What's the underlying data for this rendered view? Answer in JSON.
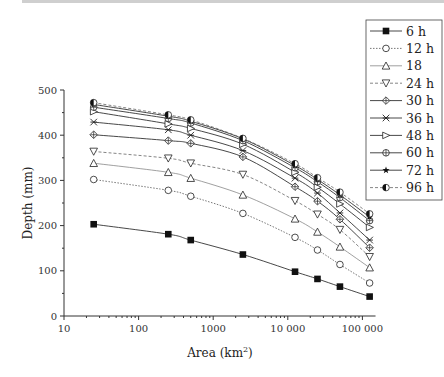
{
  "chart_data": {
    "type": "line",
    "title": "",
    "xlabel": "Area (km²)",
    "xlabel_base": "Area (km",
    "xlabel_sup": "2",
    "xlabel_end": ")",
    "ylabel": "Depth (mm)",
    "xscale": "log",
    "xlim": [
      10,
      150000
    ],
    "ylim": [
      0,
      500
    ],
    "x_ticks": [
      10,
      100,
      1000,
      10000,
      100000
    ],
    "x_tick_labels": [
      "10",
      "100",
      "1000",
      "10 000",
      "100 000"
    ],
    "y_ticks": [
      0,
      100,
      200,
      300,
      400,
      500
    ],
    "y_tick_labels": [
      "0",
      "100",
      "200",
      "300",
      "400",
      "500"
    ],
    "grid": false,
    "legend_position": "upper right (outside plot area)",
    "x": [
      25,
      250,
      500,
      2500,
      12500,
      25000,
      50000,
      125000
    ],
    "series": [
      {
        "name": "6 h",
        "marker": "filled-square",
        "line": "solid",
        "values": [
          203,
          181,
          168,
          136,
          98,
          82,
          65,
          43
        ]
      },
      {
        "name": "12 h",
        "marker": "open-circle",
        "line": "dotted",
        "values": [
          302,
          278,
          265,
          227,
          174,
          146,
          114,
          73
        ]
      },
      {
        "name": "18",
        "marker": "open-triangle-up",
        "line": "solid-light",
        "values": [
          338,
          318,
          305,
          268,
          215,
          186,
          153,
          107
        ]
      },
      {
        "name": "24 h",
        "marker": "open-triangle-down",
        "line": "dashed",
        "values": [
          364,
          349,
          338,
          313,
          255,
          225,
          191,
          131
        ]
      },
      {
        "name": "30 h",
        "marker": "diamond-cross",
        "line": "solid",
        "values": [
          401,
          388,
          382,
          352,
          286,
          254,
          214,
          151
        ]
      },
      {
        "name": "36 h",
        "marker": "x-cross",
        "line": "solid",
        "values": [
          429,
          412,
          400,
          366,
          305,
          272,
          228,
          168
        ]
      },
      {
        "name": "48 h",
        "marker": "triangle-right",
        "line": "solid",
        "values": [
          452,
          425,
          415,
          380,
          318,
          285,
          248,
          196
        ]
      },
      {
        "name": "60 h",
        "marker": "circle-cross",
        "line": "solid",
        "values": [
          462,
          437,
          427,
          388,
          328,
          297,
          262,
          211
        ]
      },
      {
        "name": "72 h",
        "marker": "star",
        "line": "solid",
        "values": [
          468,
          442,
          431,
          392,
          333,
          302,
          268,
          219
        ]
      },
      {
        "name": "96 h",
        "marker": "half-filled-circle",
        "line": "dashed",
        "values": [
          472,
          445,
          434,
          393,
          337,
          306,
          274,
          226
        ]
      }
    ]
  }
}
